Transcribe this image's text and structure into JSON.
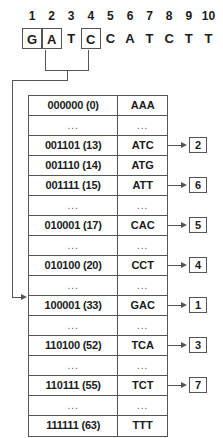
{
  "sequence": {
    "positions": [
      "1",
      "2",
      "3",
      "4",
      "5",
      "6",
      "7",
      "8",
      "9",
      "10"
    ],
    "bases": [
      {
        "letter": "G",
        "boxed": true
      },
      {
        "letter": "A",
        "boxed": true
      },
      {
        "letter": "T",
        "boxed": false
      },
      {
        "letter": "C",
        "boxed": true
      },
      {
        "letter": "C",
        "boxed": false
      },
      {
        "letter": "A",
        "boxed": false
      },
      {
        "letter": "T",
        "boxed": false
      },
      {
        "letter": "C",
        "boxed": false
      },
      {
        "letter": "T",
        "boxed": false
      },
      {
        "letter": "T",
        "boxed": false
      }
    ]
  },
  "table": {
    "rows": [
      {
        "code": "000000 (0)",
        "codon": "AAA",
        "gap": false,
        "out": null
      },
      {
        "code": "...",
        "codon": "...",
        "gap": true,
        "out": null
      },
      {
        "code": "001101 (13)",
        "codon": "ATC",
        "gap": false,
        "out": "2"
      },
      {
        "code": "001110 (14)",
        "codon": "ATG",
        "gap": false,
        "out": null
      },
      {
        "code": "001111 (15)",
        "codon": "ATT",
        "gap": false,
        "out": "6"
      },
      {
        "code": "...",
        "codon": "...",
        "gap": true,
        "out": null
      },
      {
        "code": "010001 (17)",
        "codon": "CAC",
        "gap": false,
        "out": "5"
      },
      {
        "code": "...",
        "codon": "...",
        "gap": true,
        "out": null
      },
      {
        "code": "010100 (20)",
        "codon": "CCT",
        "gap": false,
        "out": "4"
      },
      {
        "code": "...",
        "codon": "...",
        "gap": true,
        "out": null
      },
      {
        "code": "100001 (33)",
        "codon": "GAC",
        "gap": false,
        "out": "1"
      },
      {
        "code": "...",
        "codon": "...",
        "gap": true,
        "out": null
      },
      {
        "code": "110100 (52)",
        "codon": "TCA",
        "gap": false,
        "out": "3"
      },
      {
        "code": "...",
        "codon": "...",
        "gap": true,
        "out": null
      },
      {
        "code": "110111 (55)",
        "codon": "TCT",
        "gap": false,
        "out": "7"
      },
      {
        "code": "...",
        "codon": "...",
        "gap": true,
        "out": null
      },
      {
        "code": "111111 (63)",
        "codon": "TTT",
        "gap": false,
        "out": null
      }
    ]
  },
  "colors": {
    "line": "#555555",
    "text": "#1a1a1a"
  }
}
